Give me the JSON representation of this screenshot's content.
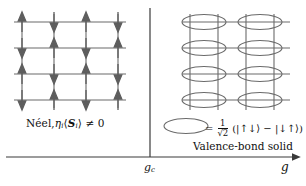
{
  "figure": {
    "type": "phase-diagram",
    "background": "#ffffff",
    "line_color": "#6b6b6b",
    "axis_color": "#3a3a3a",
    "width": 306,
    "height": 186
  },
  "left_panel": {
    "name": "neel-phase",
    "lattice": {
      "rows": 4,
      "cols": 4,
      "x0": 22,
      "y0": 22,
      "dx": 32,
      "dy": 26,
      "spin_pattern": "antiferromagnetic-alternating",
      "spins": [
        [
          "up",
          "down",
          "up",
          "down"
        ],
        [
          "down",
          "up",
          "down",
          "up"
        ],
        [
          "up",
          "down",
          "up",
          "down"
        ],
        [
          "down",
          "up",
          "down",
          "up"
        ]
      ]
    },
    "caption": {
      "text_plain": "Néel, ηi⟨Si⟩ ≠ 0",
      "prefix": "Néel,",
      "eta": "η",
      "eta_sub": "i",
      "bra": "⟨",
      "spin_symbol": "S",
      "spin_sub": "i",
      "ket": "⟩",
      "relation": "≠ 0"
    }
  },
  "right_panel": {
    "name": "valence-bond-solid-phase",
    "lattice": {
      "rows": 4,
      "cols": 4,
      "x0": 190,
      "y0": 22,
      "dx": 28,
      "dy": 26,
      "dimer_orientation": "horizontal",
      "dimer_columns": [
        0,
        2
      ],
      "dimer_rows": [
        0,
        1,
        2,
        3
      ]
    },
    "caption": "Valence-bond solid",
    "legend": {
      "symbol": "ellipse",
      "equals": "=",
      "coefficient_numerator": "1",
      "coefficient_denominator": "√2",
      "state": "(|↑↓⟩ − |↓↑⟩)",
      "ket_up_down": "|↑↓⟩",
      "minus": "−",
      "ket_down_up": "|↓↑⟩",
      "open_paren": "(",
      "close_paren": ")"
    }
  },
  "axis": {
    "name": "coupling-axis",
    "label": "g",
    "critical_point_label": "g",
    "critical_point_sub": "c",
    "critical_x": 150,
    "y": 157,
    "x_start": 6,
    "x_end": 296,
    "arrow": "right"
  }
}
